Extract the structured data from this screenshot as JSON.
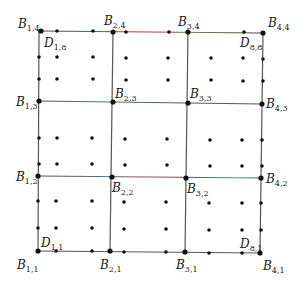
{
  "diagram": {
    "title": "",
    "line_color": "#555555",
    "dot_color": "#111111",
    "accent_colors": {
      "red": "#c0392b",
      "green": "#3a9a5a",
      "blue": "#4a6fa5"
    },
    "grid_x": [
      39,
      111,
      186,
      262
    ],
    "grid_y": [
      31,
      102,
      177,
      252
    ],
    "dot_cols": [
      39,
      57,
      92,
      111,
      125,
      167,
      186,
      210,
      242,
      262
    ],
    "dot_rows": [
      31,
      57,
      79,
      102,
      138,
      164,
      177,
      208,
      234,
      252
    ],
    "lines": [
      {
        "id": "h4",
        "x1": 39,
        "y1": 31,
        "x2": 262,
        "y2": 33,
        "segments": [
          "#3a6b3a",
          "#c0392b",
          "#3a9a5a"
        ]
      },
      {
        "id": "h3",
        "x1": 39,
        "y1": 101,
        "x2": 262,
        "y2": 104,
        "segments": [
          "#3a9a5a",
          "#555555",
          "#555555"
        ]
      },
      {
        "id": "h2",
        "x1": 38,
        "y1": 176,
        "x2": 261,
        "y2": 178,
        "segments": [
          "#4a6fa5",
          "#c0392b",
          "#3a9a5a"
        ]
      },
      {
        "id": "h1",
        "x1": 38,
        "y1": 251,
        "x2": 260,
        "y2": 253,
        "segments": [
          "#555555",
          "#555555",
          "#555555"
        ]
      },
      {
        "id": "v1",
        "x1": 39,
        "y1": 31,
        "x2": 38,
        "y2": 251
      },
      {
        "id": "v2",
        "x1": 113,
        "y1": 32,
        "x2": 110,
        "y2": 251
      },
      {
        "id": "v3",
        "x1": 188,
        "y1": 32,
        "x2": 185,
        "y2": 252
      },
      {
        "id": "v4",
        "x1": 263,
        "y1": 33,
        "x2": 260,
        "y2": 253
      }
    ],
    "dots": [
      [
        41,
        31
      ],
      [
        57,
        31
      ],
      [
        93,
        31
      ],
      [
        113,
        32
      ],
      [
        126,
        32
      ],
      [
        169,
        32
      ],
      [
        188,
        32
      ],
      [
        244,
        32
      ],
      [
        263,
        33
      ],
      [
        39,
        57
      ],
      [
        57,
        57
      ],
      [
        93,
        57
      ],
      [
        126,
        58
      ],
      [
        168,
        58
      ],
      [
        211,
        58
      ],
      [
        243,
        58
      ],
      [
        263,
        59
      ],
      [
        39,
        79
      ],
      [
        57,
        79
      ],
      [
        93,
        79
      ],
      [
        126,
        80
      ],
      [
        168,
        80
      ],
      [
        211,
        80
      ],
      [
        243,
        81
      ],
      [
        263,
        81
      ],
      [
        39,
        101
      ],
      [
        113,
        102
      ],
      [
        188,
        103
      ],
      [
        262,
        104
      ],
      [
        39,
        138
      ],
      [
        57,
        138
      ],
      [
        92,
        138
      ],
      [
        125,
        139
      ],
      [
        167,
        139
      ],
      [
        210,
        140
      ],
      [
        242,
        140
      ],
      [
        262,
        140
      ],
      [
        39,
        164
      ],
      [
        57,
        164
      ],
      [
        92,
        164
      ],
      [
        125,
        165
      ],
      [
        167,
        165
      ],
      [
        210,
        166
      ],
      [
        242,
        166
      ],
      [
        262,
        166
      ],
      [
        38,
        176
      ],
      [
        112,
        177
      ],
      [
        186,
        178
      ],
      [
        261,
        178
      ],
      [
        38,
        201
      ],
      [
        56,
        201
      ],
      [
        92,
        201
      ],
      [
        124,
        202
      ],
      [
        166,
        202
      ],
      [
        209,
        203
      ],
      [
        242,
        203
      ],
      [
        261,
        203
      ],
      [
        38,
        228
      ],
      [
        56,
        228
      ],
      [
        92,
        228
      ],
      [
        124,
        229
      ],
      [
        166,
        229
      ],
      [
        209,
        230
      ],
      [
        242,
        230
      ],
      [
        261,
        230
      ],
      [
        38,
        251
      ],
      [
        56,
        251
      ],
      [
        92,
        251
      ],
      [
        110,
        251
      ],
      [
        124,
        252
      ],
      [
        166,
        252
      ],
      [
        185,
        252
      ],
      [
        209,
        253
      ],
      [
        242,
        253
      ],
      [
        260,
        253
      ]
    ],
    "labels": [
      {
        "id": "B14",
        "base": "B",
        "sub": "1,4",
        "x": 18,
        "y": 18
      },
      {
        "id": "B24",
        "base": "B",
        "sub": "2,4",
        "x": 104,
        "y": 15
      },
      {
        "id": "B34",
        "base": "B",
        "sub": "3,4",
        "x": 178,
        "y": 16
      },
      {
        "id": "B44",
        "base": "B",
        "sub": "4,4",
        "x": 268,
        "y": 17
      },
      {
        "id": "D18",
        "base": "D",
        "sub": "1,8",
        "x": 44,
        "y": 37
      },
      {
        "id": "D88",
        "base": "D",
        "sub": "8,8",
        "x": 240,
        "y": 37
      },
      {
        "id": "B23",
        "base": "B",
        "sub": "2,3",
        "x": 115,
        "y": 88
      },
      {
        "id": "B33",
        "base": "B",
        "sub": "3,3",
        "x": 190,
        "y": 88
      },
      {
        "id": "B13",
        "base": "B",
        "sub": "1,3",
        "x": 16,
        "y": 96
      },
      {
        "id": "B43",
        "base": "B",
        "sub": "4,3",
        "x": 266,
        "y": 98
      },
      {
        "id": "B12",
        "base": "B",
        "sub": "1,2",
        "x": 16,
        "y": 171
      },
      {
        "id": "B42",
        "base": "B",
        "sub": "4,2",
        "x": 266,
        "y": 173
      },
      {
        "id": "B22",
        "base": "B",
        "sub": "2,2",
        "x": 112,
        "y": 182
      },
      {
        "id": "B32",
        "base": "B",
        "sub": "3,2",
        "x": 187,
        "y": 183
      },
      {
        "id": "D11",
        "base": "D",
        "sub": "1,1",
        "x": 41,
        "y": 237
      },
      {
        "id": "D81",
        "base": "D",
        "sub": "8,1",
        "x": 240,
        "y": 238
      },
      {
        "id": "B11",
        "base": "B",
        "sub": "1,1",
        "x": 17,
        "y": 259
      },
      {
        "id": "B21",
        "base": "B",
        "sub": "2,1",
        "x": 100,
        "y": 259
      },
      {
        "id": "B31",
        "base": "B",
        "sub": "3,1",
        "x": 176,
        "y": 259
      },
      {
        "id": "B41",
        "base": "B",
        "sub": "4,1",
        "x": 263,
        "y": 260
      }
    ]
  }
}
